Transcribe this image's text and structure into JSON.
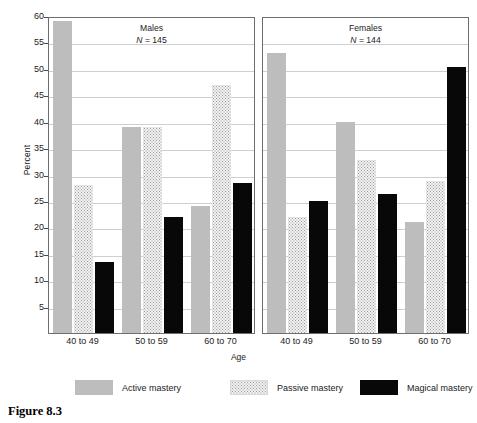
{
  "figure": {
    "caption": "Figure 8.3"
  },
  "chart_data": {
    "type": "bar",
    "title": "",
    "xlabel": "Age",
    "ylabel": "Percent",
    "ylim": [
      0,
      60
    ],
    "yticks": [
      60,
      55,
      50,
      45,
      40,
      35,
      30,
      25,
      20,
      15,
      10,
      5
    ],
    "grid": true,
    "legend_position": "bottom",
    "categories": [
      "40 to 49",
      "50 to 59",
      "60 to 70"
    ],
    "series": [
      {
        "name": "Active mastery",
        "color": "#bdbdbd"
      },
      {
        "name": "Passive mastery",
        "color": "#f2f2f2"
      },
      {
        "name": "Magical mastery",
        "color": "#080808"
      }
    ],
    "panels": [
      {
        "name": "Males",
        "n_label": "(N = 145)",
        "n": 145,
        "values": {
          "Active mastery": [
            59,
            39,
            24
          ],
          "Passive mastery": [
            28,
            39,
            47
          ],
          "Magical mastery": [
            13.5,
            22,
            28.3
          ]
        }
      },
      {
        "name": "Females",
        "n_label": "(N = 144)",
        "n": 144,
        "values": {
          "Active mastery": [
            53,
            40,
            21
          ],
          "Passive mastery": [
            22,
            32.8,
            28.7
          ],
          "Magical mastery": [
            25,
            26.3,
            50.3
          ]
        }
      }
    ]
  }
}
